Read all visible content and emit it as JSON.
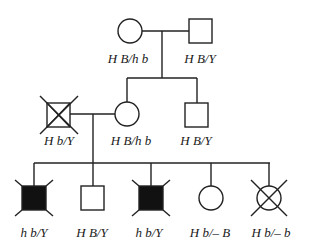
{
  "diagram": {
    "type": "pedigree",
    "colors": {
      "line": "#222222",
      "affected_fill": "#111111",
      "background": "#ffffff"
    },
    "generations": [
      {
        "name": "generation-1",
        "individuals": [
          {
            "id": "g1-female",
            "sex": "female",
            "affected": false,
            "deceased": false,
            "genotype": "H B/h b"
          },
          {
            "id": "g1-male",
            "sex": "male",
            "affected": false,
            "deceased": false,
            "genotype": "H B/Y"
          }
        ]
      },
      {
        "name": "generation-2",
        "individuals": [
          {
            "id": "g2-male-spouse",
            "sex": "male",
            "affected": false,
            "deceased": true,
            "genotype": "H b/Y"
          },
          {
            "id": "g2-female",
            "sex": "female",
            "affected": false,
            "deceased": false,
            "genotype": "H B/h b"
          },
          {
            "id": "g2-male",
            "sex": "male",
            "affected": false,
            "deceased": false,
            "genotype": "H B/Y"
          }
        ]
      },
      {
        "name": "generation-3",
        "individuals": [
          {
            "id": "g3-1",
            "sex": "male",
            "affected": true,
            "deceased": false,
            "marked_corners": true,
            "genotype": "h b/Y"
          },
          {
            "id": "g3-2",
            "sex": "male",
            "affected": false,
            "deceased": false,
            "genotype": "H B/Y"
          },
          {
            "id": "g3-3",
            "sex": "male",
            "affected": true,
            "deceased": false,
            "marked_corners": true,
            "genotype": "h b/Y"
          },
          {
            "id": "g3-4",
            "sex": "female",
            "affected": false,
            "deceased": false,
            "genotype": "H b/– B"
          },
          {
            "id": "g3-5",
            "sex": "female",
            "affected": false,
            "deceased": true,
            "genotype": "H b/– b"
          }
        ]
      }
    ]
  },
  "labels": {
    "g1_female": "H B/h b",
    "g1_male": "H B/Y",
    "g2_spouse": "H b/Y",
    "g2_female": "H B/h b",
    "g2_male": "H B/Y",
    "g3_1": "h b/Y",
    "g3_2": "H B/Y",
    "g3_3": "h b/Y",
    "g3_4": "H b/– B",
    "g3_5": "H b/– b"
  }
}
